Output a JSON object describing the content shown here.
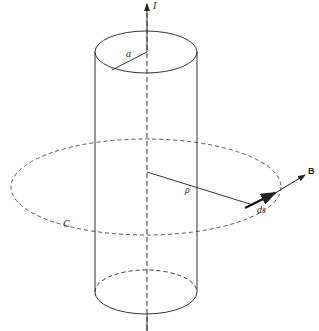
{
  "diagram": {
    "labels": {
      "current": "I",
      "radius": "a",
      "distance": "ρ",
      "element": "ds",
      "field": "B",
      "contour": "C"
    },
    "colors": {
      "line": "#333333",
      "background": "#ffffff"
    }
  }
}
